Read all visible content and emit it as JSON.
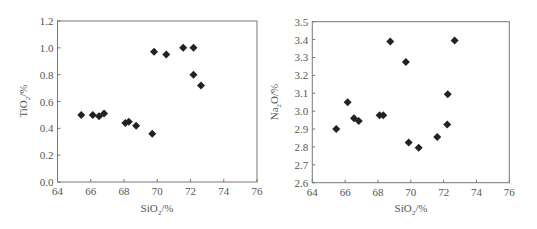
{
  "chart_data": [
    {
      "type": "scatter",
      "title": "",
      "xlabel": "SiO2/%",
      "ylabel": "TiO2/%",
      "xlim": [
        64,
        76
      ],
      "ylim": [
        0.0,
        1.2
      ],
      "xticks": [
        "64",
        "66",
        "68",
        "70",
        "72",
        "74",
        "76"
      ],
      "yticks": [
        "0.0",
        "0.2",
        "0.4",
        "0.6",
        "0.8",
        "1.0",
        "1.2"
      ],
      "grid": false,
      "marker": "diamond",
      "series": [
        {
          "name": "samples",
          "x": [
            65.43,
            66.12,
            66.5,
            66.8,
            68.08,
            68.29,
            68.73,
            69.7,
            69.81,
            70.54,
            71.56,
            72.18,
            72.18,
            72.63
          ],
          "y": [
            0.5,
            0.5,
            0.49,
            0.51,
            0.44,
            0.45,
            0.42,
            0.36,
            0.97,
            0.95,
            1.0,
            1.0,
            0.8,
            0.72
          ]
        }
      ]
    },
    {
      "type": "scatter",
      "title": "",
      "xlabel": "SiO2/%",
      "ylabel": "Na2O/%",
      "xlim": [
        64,
        76
      ],
      "ylim": [
        2.6,
        3.5
      ],
      "xticks": [
        "64",
        "66",
        "68",
        "70",
        "72",
        "74",
        "76"
      ],
      "yticks": [
        "2.6",
        "2.7",
        "2.8",
        "2.9",
        "3.0",
        "3.1",
        "3.2",
        "3.3",
        "3.4",
        "3.5"
      ],
      "grid": false,
      "marker": "diamond",
      "series": [
        {
          "name": "samples",
          "x": [
            65.46,
            66.15,
            66.54,
            66.83,
            68.1,
            68.32,
            68.75,
            69.7,
            69.87,
            70.48,
            71.61,
            72.25,
            72.22,
            72.67
          ],
          "y": [
            2.9,
            3.05,
            2.96,
            2.945,
            2.977,
            2.977,
            3.39,
            3.275,
            2.825,
            2.795,
            2.855,
            3.095,
            2.925,
            3.395
          ]
        }
      ]
    }
  ],
  "labels": {
    "left": {
      "x_main": "SiO",
      "x_sub": "2",
      "x_tail": "/%",
      "y_main": "TiO",
      "y_sub": "2",
      "y_tail": "/%"
    },
    "right": {
      "x_main": "SiO",
      "x_sub": "2",
      "x_tail": "/%",
      "y_main": "Na",
      "y_sub": "2",
      "y_tail": "O/%"
    }
  }
}
